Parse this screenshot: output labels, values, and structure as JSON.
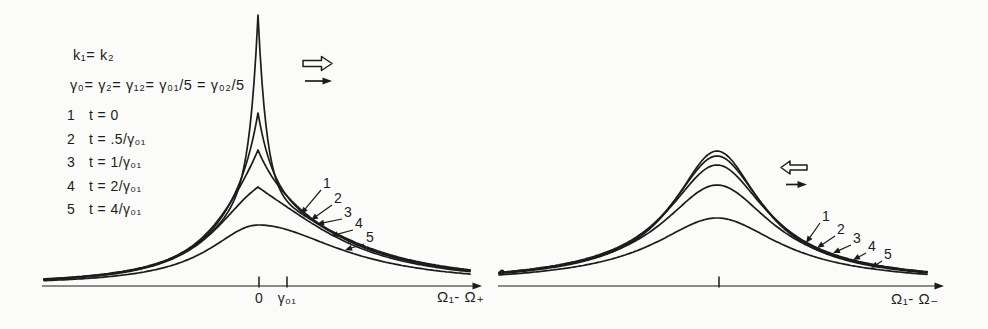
{
  "colors": {
    "background": "#fbfbf9",
    "ink": "#1c1c1c"
  },
  "conditions": {
    "line1": "k₁= k₂",
    "line2": "γ₀= γ₂= γ₁₂= γ₀₁/5 = γ₀₂/5"
  },
  "legend": {
    "rows": [
      {
        "index": "1",
        "value": "t = 0"
      },
      {
        "index": "2",
        "value": "t = .5/γ₀₁"
      },
      {
        "index": "3",
        "value": "t = 1/γ₀₁"
      },
      {
        "index": "4",
        "value": "t = 2/γ₀₁"
      },
      {
        "index": "5",
        "value": "t = 4/γ₀₁"
      }
    ]
  },
  "markers": {
    "left_panel": {
      "open_arrow_direction": "right",
      "solid_arrow_direction": "right"
    },
    "right_panel": {
      "open_arrow_direction": "left",
      "solid_arrow_direction": "right"
    }
  },
  "chart_data": [
    {
      "type": "line",
      "panel": "left",
      "title": "",
      "xlabel": "Ω₁- Ω₊",
      "ylabel": "",
      "grid": false,
      "x_ticks": [
        {
          "label": "0",
          "px": 259
        },
        {
          "label": "γ₀₁",
          "px": 287
        }
      ],
      "center_px": 258,
      "baseline_px": 285,
      "domain_px": [
        44,
        470
      ],
      "peak_heights_rel": [
        1.0,
        0.64,
        0.5,
        0.36,
        0.22
      ],
      "series": [
        {
          "name": "1",
          "t": "t = 0",
          "exp_amp": 187,
          "exp_w": 9,
          "lor_amp": 83,
          "lor_wl": 60,
          "lor_wr": 100,
          "lor_k": 1,
          "label_px": [
            323,
            175
          ],
          "tip_px": [
            301,
            214
          ]
        },
        {
          "name": "2",
          "t": "t = .5/γ₀₁",
          "exp_amp": 92,
          "exp_w": 16,
          "lor_amp": 80,
          "lor_wl": 60,
          "lor_wr": 100,
          "lor_k": 1,
          "label_px": [
            334,
            190
          ],
          "tip_px": [
            311,
            220
          ]
        },
        {
          "name": "3",
          "t": "t = 1/γ₀₁",
          "exp_amp": 57,
          "exp_w": 24,
          "lor_amp": 78,
          "lor_wl": 60,
          "lor_wr": 100,
          "lor_k": 1,
          "label_px": [
            344,
            204
          ],
          "tip_px": [
            317,
            224
          ]
        },
        {
          "name": "4",
          "t": "t = 2/γ₀₁",
          "exp_amp": 25,
          "exp_w": 34,
          "lor_amp": 73,
          "lor_wl": 60,
          "lor_wr": 100,
          "lor_k": 1,
          "label_px": [
            355,
            215
          ],
          "tip_px": [
            331,
            236
          ]
        },
        {
          "name": "5",
          "t": "t = 4/γ₀₁",
          "exp_amp": 0,
          "exp_w": 1,
          "lor_amp": 60,
          "lor_wl": 60,
          "lor_wr": 100,
          "lor_k": 1,
          "label_px": [
            366,
            229
          ],
          "tip_px": [
            345,
            250
          ]
        }
      ]
    },
    {
      "type": "line",
      "panel": "right",
      "title": "",
      "xlabel": "Ω₁- Ω₋",
      "ylabel": "",
      "grid": false,
      "x_ticks": [
        {
          "label": "",
          "px": 719
        }
      ],
      "center_px": 717,
      "baseline_px": 285,
      "domain_px": [
        499,
        927
      ],
      "peak_heights_rel": [
        0.5,
        0.48,
        0.44,
        0.37,
        0.25
      ],
      "series": [
        {
          "name": "1",
          "t": "t = 0",
          "exp_amp": 0,
          "exp_w": 1,
          "lor_amp": 134,
          "lor_wl": 48,
          "lor_wr": 48,
          "lor_k": 0.8,
          "label_px": [
            822,
            208
          ],
          "tip_px": [
            806,
            243
          ]
        },
        {
          "name": "2",
          "t": "t = .5/γ₀₁",
          "exp_amp": 0,
          "exp_w": 1,
          "lor_amp": 129,
          "lor_wl": 51,
          "lor_wr": 51,
          "lor_k": 0.8,
          "label_px": [
            837,
            221
          ],
          "tip_px": [
            817,
            248
          ]
        },
        {
          "name": "3",
          "t": "t = 1/γ₀₁",
          "exp_amp": 0,
          "exp_w": 1,
          "lor_amp": 120,
          "lor_wl": 55,
          "lor_wr": 55,
          "lor_k": 0.8,
          "label_px": [
            853,
            230
          ],
          "tip_px": [
            833,
            253
          ]
        },
        {
          "name": "4",
          "t": "t = 2/γ₀₁",
          "exp_amp": 0,
          "exp_w": 1,
          "lor_amp": 100,
          "lor_wl": 61,
          "lor_wr": 61,
          "lor_k": 0.8,
          "label_px": [
            868,
            238
          ],
          "tip_px": [
            853,
            260
          ]
        },
        {
          "name": "5",
          "t": "t = 4/γ₀₁",
          "exp_amp": 0,
          "exp_w": 1,
          "lor_amp": 67,
          "lor_wl": 70,
          "lor_wr": 70,
          "lor_k": 0.8,
          "label_px": [
            884,
            246
          ],
          "tip_px": [
            871,
            268
          ]
        }
      ]
    }
  ]
}
